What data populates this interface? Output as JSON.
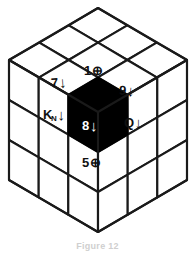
{
  "figure": {
    "caption": "Figure 12",
    "colors": {
      "line": "#1a1a1a",
      "facet_fill": "#ffffff",
      "shaded_cubie": "#000000",
      "shaded_text": "#ffffff",
      "background": "#ffffff"
    },
    "geometry": {
      "grid": "3x3x3",
      "visible_faces": [
        "top",
        "left",
        "right"
      ],
      "apex_top": [
        98,
        8
      ],
      "apex_bottom": [
        98,
        232
      ],
      "left_extent": [
        9,
        60
      ],
      "right_extent": [
        187,
        60
      ]
    }
  },
  "labels": [
    {
      "id": "label-1",
      "value": "1",
      "subscript": "",
      "glyph": "⊕",
      "glyph_name": "circled-plus-icon",
      "arrow": "",
      "on_shaded": false,
      "position": "top-edge-above-hexagon"
    },
    {
      "id": "label-7",
      "value": "7",
      "subscript": "",
      "glyph": "",
      "glyph_name": "down-arrow-icon",
      "arrow": "↓",
      "on_shaded": false,
      "position": "upper-left-of-hexagon"
    },
    {
      "id": "label-9",
      "value": "9",
      "subscript": "",
      "glyph": "",
      "glyph_name": "down-arrow-icon",
      "arrow": "↓",
      "on_shaded": false,
      "position": "upper-right-of-hexagon"
    },
    {
      "id": "label-kn",
      "value": "K",
      "subscript": "N",
      "glyph": "",
      "glyph_name": "down-arrow-icon",
      "arrow": "↓",
      "on_shaded": false,
      "position": "left-of-hexagon"
    },
    {
      "id": "label-q",
      "value": "Q",
      "subscript": "",
      "glyph": "",
      "glyph_name": "down-arrow-icon",
      "arrow": "↓",
      "on_shaded": false,
      "position": "right-of-hexagon"
    },
    {
      "id": "label-8",
      "value": "8",
      "subscript": "",
      "glyph": "",
      "glyph_name": "down-arrow-icon",
      "arrow": "↓",
      "on_shaded": true,
      "position": "center-of-hexagon"
    },
    {
      "id": "label-5",
      "value": "5",
      "subscript": "",
      "glyph": "⊕",
      "glyph_name": "circled-plus-icon",
      "arrow": "",
      "on_shaded": false,
      "position": "below-hexagon"
    }
  ]
}
